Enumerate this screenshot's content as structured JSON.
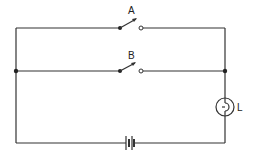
{
  "diagram": {
    "type": "circuit",
    "colors": {
      "wire": "#333333",
      "background": "#ffffff"
    },
    "components": {
      "switch_a": {
        "label": "A",
        "state": "open"
      },
      "switch_b": {
        "label": "B",
        "state": "open"
      },
      "lamp": {
        "label": "L"
      },
      "battery": {
        "label": ""
      }
    }
  }
}
